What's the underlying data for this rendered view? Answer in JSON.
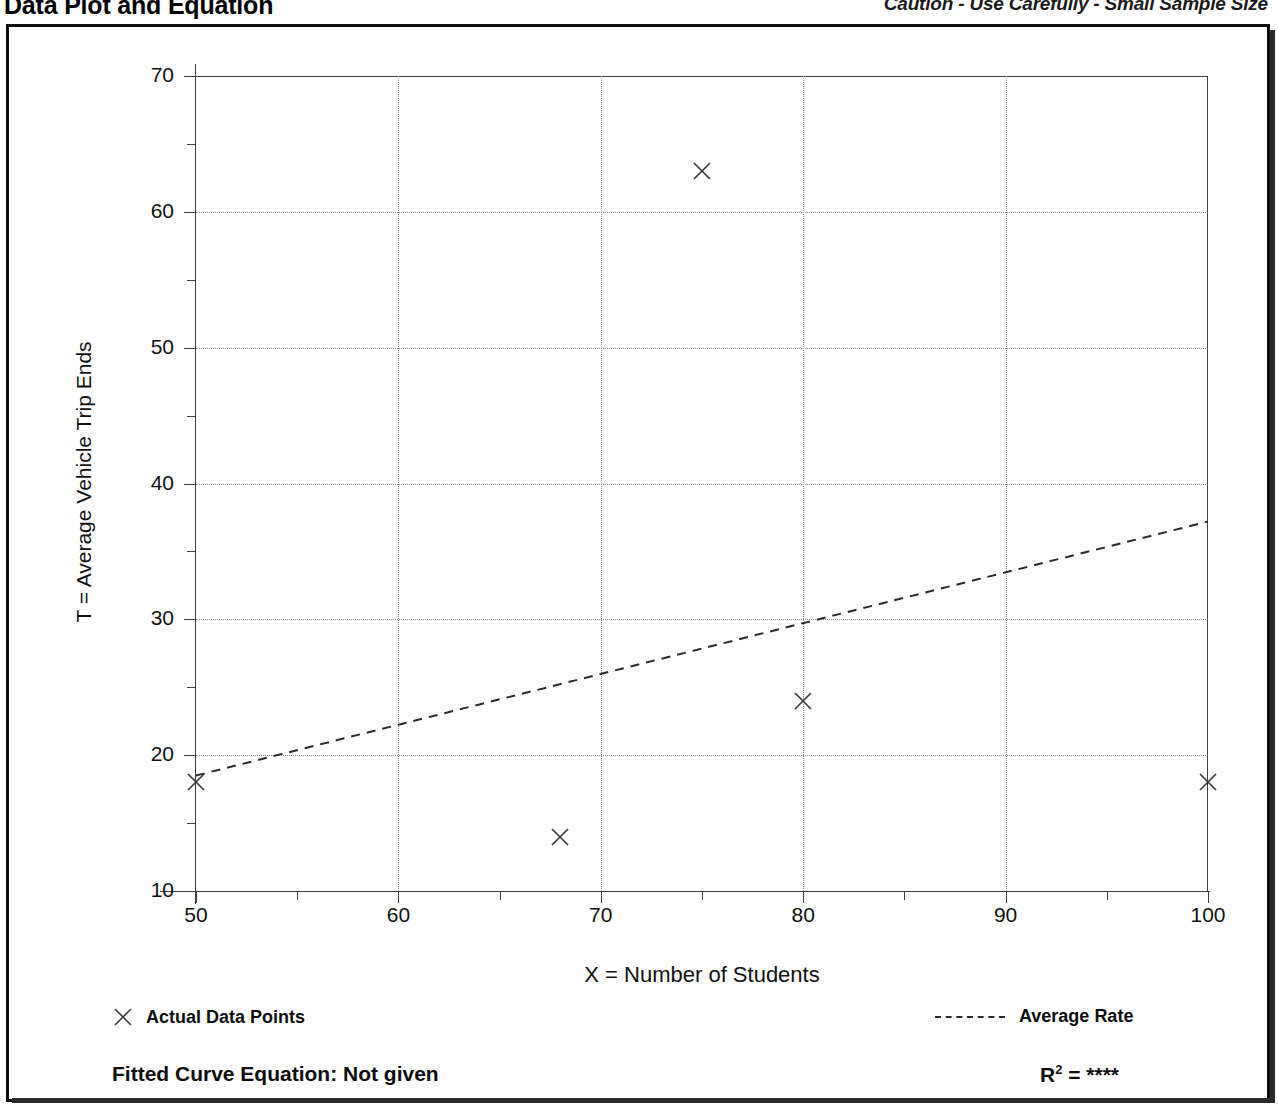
{
  "header": {
    "title": "Data Plot and Equation",
    "caution": "Caution - Use Carefully - Small Sample Size"
  },
  "legend": {
    "points_label": "Actual Data Points",
    "line_label": "Average Rate",
    "point_marker": "x-marker-icon",
    "line_marker": "dashed-line-icon"
  },
  "footer": {
    "equation_label": "Fitted Curve Equation:  Not given",
    "r_squared_prefix": "R",
    "r_squared_exponent": "2",
    "r_squared_value": "= ****"
  },
  "chart_data": {
    "type": "scatter",
    "title": "Data Plot and Equation",
    "subtitle": "Caution - Use Carefully - Small Sample Size",
    "xlabel": "X = Number of Students",
    "ylabel": "T = Average Vehicle Trip Ends",
    "xlim": [
      50,
      100
    ],
    "ylim": [
      10,
      70
    ],
    "xticks": [
      50,
      60,
      70,
      80,
      90,
      100
    ],
    "yticks": [
      10,
      20,
      30,
      40,
      50,
      60,
      70
    ],
    "xminorticks": [
      55,
      65,
      75,
      85,
      95
    ],
    "yminorticks": [
      15,
      25,
      35,
      45,
      55,
      65
    ],
    "grid": true,
    "grid_style": "dotted",
    "legend_position": "below-axes",
    "series": [
      {
        "name": "Actual Data Points",
        "type": "scatter",
        "marker": "x",
        "points": [
          {
            "x": 50,
            "y": 18
          },
          {
            "x": 68,
            "y": 14
          },
          {
            "x": 75,
            "y": 63
          },
          {
            "x": 80,
            "y": 24
          },
          {
            "x": 100,
            "y": 18
          }
        ]
      },
      {
        "name": "Average Rate",
        "type": "line",
        "style": "dashed",
        "points": [
          {
            "x": 50,
            "y": 18.5
          },
          {
            "x": 100,
            "y": 37.2
          }
        ]
      }
    ]
  }
}
